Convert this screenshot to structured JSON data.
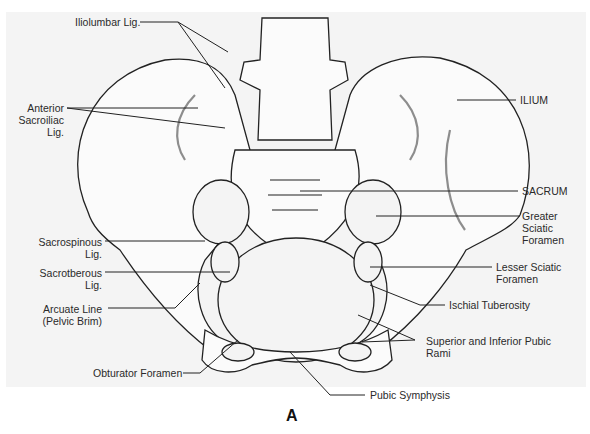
{
  "figure": {
    "caption": "A",
    "labels": {
      "iliolumbar": "Iliolumbar Lig.",
      "ant_sacroiliac": "Anterior\nSacroiliac\nLig.",
      "ilium": "ILIUM",
      "sacrum": "SACRUM",
      "greater_sciatic": "Greater\nSciatic\nForamen",
      "sacrospinous": "Sacrospinous\nLig.",
      "sacrotuberous": "Sacrotberous\nLig.",
      "lesser_sciatic": "Lesser Sciatic\nForamen",
      "ischial_tuberosity": "Ischial Tuberosity",
      "arcuate_line": "Arcuate Line\n(Pelvic Brim)",
      "pubic_rami": "Superior and Inferior Pubic\nRami",
      "obturator": "Obturator Foramen",
      "pubic_symphysis": "Pubic Symphysis"
    }
  }
}
